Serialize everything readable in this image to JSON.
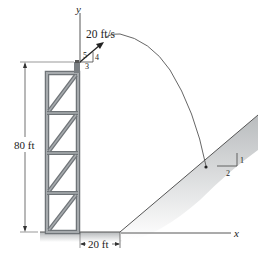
{
  "diagram": {
    "axes": {
      "y_label": "y",
      "x_label": "x"
    },
    "velocity": {
      "label": "20 ft/s",
      "slope_triangle": {
        "hyp": "5",
        "rise": "4",
        "run": "3"
      }
    },
    "tower_height": {
      "label": "80 ft"
    },
    "horizontal_offset": {
      "label": "20 ft"
    },
    "incline": {
      "slope_triangle": {
        "rise": "1",
        "run": "2"
      }
    },
    "colors": {
      "frame": "#8a8f92",
      "frame_dark": "#5b6064",
      "ground_shade": "#c9cbcc",
      "line": "#333333"
    }
  }
}
